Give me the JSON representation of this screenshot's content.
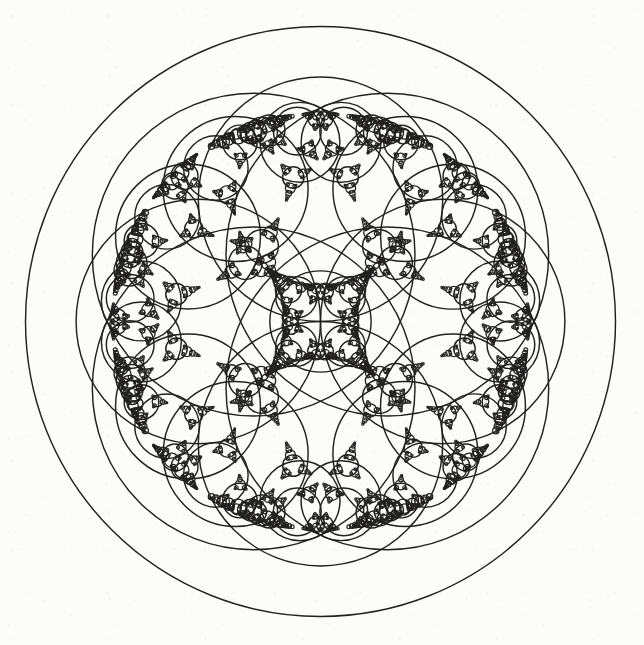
{
  "figure": {
    "kind": "apollonian-circle-packing",
    "symmetry": "4-fold",
    "width": 644,
    "height": 645,
    "background_color": "#fcfcfb",
    "stroke_color": "#22211f",
    "stroke_width": 1.45,
    "fill": "none"
  },
  "chart_data": {
    "type": "scatter",
    "xlabel": "",
    "ylabel": "",
    "xlim": [
      0,
      644
    ],
    "ylim": [
      0,
      645
    ],
    "grid": false,
    "legend": null,
    "annotations": [],
    "recursion": {
      "max_depth": 10,
      "min_radius_px": 0.85
    },
    "seed_circles": [
      {
        "name": "outer-bounding-circle",
        "cx": 320.5,
        "cy": 321.5,
        "r": 295.0,
        "bend": -0.003389830508474576,
        "role": "boundary"
      },
      {
        "name": "large-circle-top",
        "cx": 320.5,
        "cy": 199.3,
        "r": 122.2,
        "bend": 0.008183306055646482,
        "role": "generation-1"
      },
      {
        "name": "large-circle-right",
        "cx": 442.7,
        "cy": 321.5,
        "r": 122.2,
        "bend": 0.008183306055646482,
        "role": "generation-1"
      },
      {
        "name": "large-circle-bottom",
        "cx": 320.5,
        "cy": 443.7,
        "r": 122.2,
        "bend": 0.008183306055646482,
        "role": "generation-1"
      },
      {
        "name": "large-circle-left",
        "cx": 198.3,
        "cy": 321.5,
        "r": 122.2,
        "bend": 0.008183306055646482,
        "role": "generation-1"
      },
      {
        "name": "central-circle",
        "cx": 320.5,
        "cy": 321.5,
        "r": 50.62,
        "bend": 0.01975499802331055,
        "role": "generation-2"
      }
    ],
    "measured_extents": {
      "outer_circle_top_y": 26,
      "outer_circle_bottom_y": 617,
      "outer_circle_left_x": 26,
      "outer_circle_right_x": 616,
      "central_circle_diameter_px": 101
    },
    "circle_count_note": "generated procedurally; exact count depends on recursion depth and minimum radius"
  }
}
